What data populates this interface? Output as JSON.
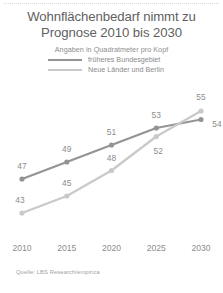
{
  "header": {
    "title_line1": "Wohnflächenbedarf nimmt zu",
    "title_line2": "Prognose 2010 bis 2030",
    "subtitle": "Angaben in Quadratmeter pro Kopf"
  },
  "legend": {
    "items": [
      {
        "label": "früheres Bundesgebiet",
        "color": "#949494"
      },
      {
        "label": "Neue Länder und Berlin",
        "color": "#c9c9c9"
      }
    ]
  },
  "source": "Quelle: LBS Research/empirica",
  "colors": {
    "line_west": "#949494",
    "line_east": "#c9c9c9",
    "text": "#8d8d8d",
    "title": "#5f5f5f",
    "background": "#ffffff"
  },
  "chart_data": {
    "type": "line",
    "subtitle": "Angaben in Quadratmeter pro Kopf",
    "xlabel": "",
    "ylabel": "Quadratmeter pro Kopf",
    "categories": [
      "2010",
      "2015",
      "2020",
      "2025",
      "2030"
    ],
    "x": [
      2010,
      2015,
      2020,
      2025,
      2030
    ],
    "ylim": [
      41,
      57
    ],
    "grid": false,
    "legend_position": "top-center",
    "series": [
      {
        "name": "früheres Bundesgebiet",
        "color": "#949494",
        "values": [
          47,
          49,
          51,
          53,
          54
        ],
        "labels": [
          "47",
          "49",
          "51",
          "53",
          "54"
        ]
      },
      {
        "name": "Neue Länder und Berlin",
        "color": "#c9c9c9",
        "values": [
          43,
          45,
          48,
          52,
          55
        ],
        "labels": [
          "43",
          "45",
          "48",
          "52",
          "55"
        ]
      }
    ],
    "source": "Quelle: LBS Research/empirica"
  }
}
